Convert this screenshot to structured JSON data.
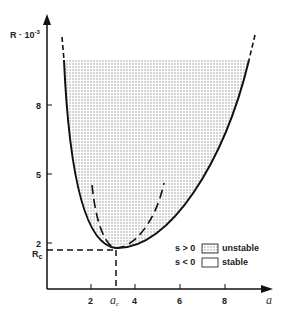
{
  "diagram": {
    "y_axis": {
      "label": "R · 10",
      "exponent": "-3",
      "ticks": [
        "8",
        "5",
        "2"
      ],
      "critical_label": "R",
      "critical_sub": "c"
    },
    "x_axis": {
      "label": "a",
      "ticks": [
        "2",
        "4",
        "6",
        "8"
      ],
      "critical_label": "a",
      "critical_sub": "c"
    },
    "legend": [
      {
        "condition": "s > 0",
        "label": "unstable",
        "pattern": "dotted"
      },
      {
        "condition": "s < 0",
        "label": "stable",
        "pattern": "empty"
      }
    ],
    "colors": {
      "ink": "#111111",
      "fill_dots": "#8a8a8a",
      "background": "#ffffff"
    }
  }
}
